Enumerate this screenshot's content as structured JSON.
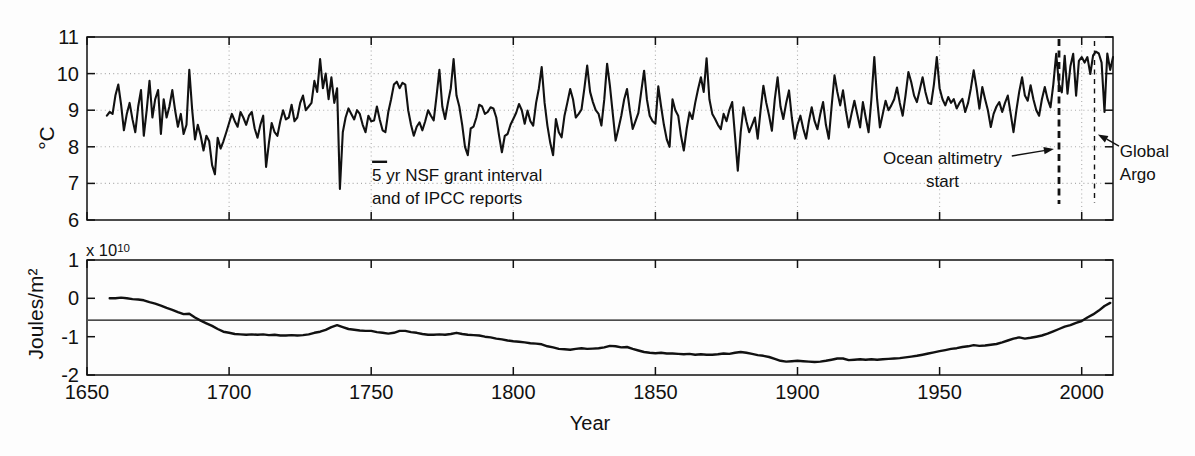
{
  "figure": {
    "background": "#fdfdfd",
    "ink": "#111111",
    "grid_color": "#ababab"
  },
  "axis_labels": {
    "top_y": "°C",
    "bottom_y": "Joules/m²",
    "x": "Year"
  },
  "chart_data": [
    {
      "type": "line",
      "panel": "top",
      "ylabel": "°C",
      "xlim": [
        1650,
        2011
      ],
      "ylim": [
        6,
        11
      ],
      "xticks": [
        1650,
        1700,
        1750,
        1800,
        1850,
        1900,
        1950,
        2000
      ],
      "xtick_labels_shown": false,
      "yticks": [
        6,
        7,
        8,
        9,
        10,
        11
      ],
      "ytick_labels": [
        "6",
        "7",
        "8",
        "9",
        "10",
        "11"
      ],
      "grid_x": [
        1700,
        1750,
        1800,
        1850,
        1900,
        1950,
        2000
      ],
      "grid_y": [
        7,
        8,
        9,
        10
      ],
      "grid_style": "dotted",
      "series": [
        {
          "start_year": 1657,
          "step": 1,
          "values": [
            8.85,
            8.95,
            8.9,
            9.4,
            9.7,
            9.15,
            8.45,
            8.9,
            9.2,
            8.75,
            8.4,
            9.1,
            9.55,
            8.3,
            9.0,
            9.8,
            8.8,
            9.3,
            9.55,
            8.35,
            9.3,
            8.8,
            9.1,
            9.55,
            9.0,
            8.55,
            8.9,
            8.35,
            8.6,
            10.1,
            9.0,
            8.2,
            8.6,
            8.3,
            7.9,
            8.3,
            8.15,
            7.5,
            7.25,
            8.25,
            7.95,
            8.15,
            8.4,
            8.65,
            8.9,
            8.7,
            8.55,
            8.95,
            8.8,
            8.6,
            8.85,
            8.95,
            8.5,
            8.25,
            8.6,
            8.85,
            7.45,
            8.1,
            8.65,
            8.4,
            8.3,
            8.7,
            9.0,
            8.75,
            8.8,
            9.15,
            8.7,
            8.8,
            9.2,
            9.4,
            9.0,
            9.1,
            9.2,
            9.8,
            9.5,
            10.4,
            9.6,
            10.0,
            9.3,
            9.9,
            9.2,
            9.6,
            6.85,
            8.4,
            8.8,
            9.05,
            8.9,
            8.75,
            9.0,
            8.9,
            8.6,
            8.4,
            8.85,
            8.7,
            8.72,
            9.1,
            8.75,
            8.45,
            8.4,
            8.95,
            9.3,
            9.7,
            9.78,
            9.6,
            9.75,
            9.7,
            9.0,
            8.6,
            8.3,
            8.55,
            8.67,
            8.45,
            8.7,
            9.0,
            8.85,
            8.72,
            9.4,
            10.1,
            9.1,
            8.76,
            9.2,
            9.6,
            10.4,
            9.4,
            9.1,
            8.6,
            8.0,
            7.77,
            8.5,
            8.55,
            8.8,
            9.15,
            9.1,
            8.9,
            8.95,
            9.08,
            9.05,
            8.8,
            8.3,
            7.85,
            8.3,
            8.35,
            8.6,
            8.76,
            8.93,
            9.17,
            9.0,
            8.63,
            8.99,
            8.7,
            8.58,
            9.2,
            9.6,
            10.18,
            9.2,
            8.58,
            8.1,
            7.77,
            8.76,
            8.4,
            8.26,
            8.85,
            9.2,
            9.58,
            9.3,
            8.8,
            8.9,
            9.02,
            9.6,
            10.22,
            9.5,
            9.22,
            9.0,
            8.9,
            8.58,
            9.3,
            10.27,
            9.67,
            8.9,
            8.17,
            8.5,
            8.85,
            9.3,
            9.58,
            9.0,
            8.49,
            8.7,
            8.93,
            9.5,
            10.08,
            9.3,
            8.85,
            8.7,
            8.63,
            9.65,
            9.1,
            8.6,
            8.2,
            8.0,
            9.3,
            9.0,
            8.85,
            8.3,
            7.9,
            8.5,
            8.94,
            8.76,
            9.2,
            9.58,
            9.9,
            9.5,
            10.42,
            9.3,
            8.9,
            8.76,
            8.6,
            8.48,
            8.9,
            8.7,
            9.0,
            9.22,
            8.3,
            7.35,
            8.4,
            9.08,
            8.7,
            8.4,
            8.6,
            8.8,
            8.22,
            9.0,
            9.67,
            9.2,
            8.85,
            8.44,
            9.3,
            9.9,
            9.1,
            8.76,
            9.2,
            9.54,
            8.8,
            8.22,
            8.6,
            8.85,
            8.5,
            8.22,
            8.7,
            9.08,
            8.7,
            8.48,
            8.9,
            9.22,
            8.6,
            8.22,
            9.1,
            9.95,
            9.5,
            9.13,
            9.54,
            9.0,
            8.53,
            8.9,
            9.26,
            8.9,
            8.53,
            9.22,
            8.8,
            8.4,
            9.3,
            10.45,
            9.3,
            8.53,
            8.9,
            9.26,
            9.0,
            9.13,
            9.3,
            9.62,
            9.2,
            8.85,
            9.4,
            10.04,
            9.77,
            9.4,
            9.22,
            9.55,
            9.9,
            9.5,
            9.2,
            9.17,
            9.7,
            10.45,
            9.6,
            9.3,
            9.13,
            9.36,
            9.2,
            9.3,
            9.05,
            9.2,
            9.31,
            8.95,
            9.2,
            9.6,
            10.09,
            9.6,
            9.04,
            9.63,
            9.3,
            9.0,
            8.54,
            8.9,
            9.1,
            9.22,
            8.95,
            9.2,
            9.4,
            8.9,
            8.4,
            9.0,
            9.5,
            9.9,
            9.4,
            9.26,
            9.68,
            9.3,
            9.0,
            8.85,
            9.3,
            9.63,
            9.3,
            9.08,
            9.7,
            10.54,
            9.7,
            9.49,
            10.49,
            9.45,
            10.2,
            10.54,
            9.4,
            10.35,
            10.45,
            10.3,
            10.45,
            9.99,
            10.5,
            10.6,
            10.55,
            10.3,
            8.95,
            10.55,
            10.1,
            10.45
          ]
        }
      ],
      "vlines": [
        {
          "year": 1992,
          "style": "thick-dashed",
          "meaning": "Ocean altimetry start"
        },
        {
          "year": 2004.5,
          "style": "thin-dashed",
          "meaning": "Global Argo"
        }
      ],
      "annotations": [
        {
          "id": "nsf",
          "lines": [
            "5 yr NSF grant interval",
            "and of IPCC reports"
          ],
          "align": "left",
          "anchor_year": 1750.3,
          "anchor_value": 7.53,
          "scalebar": {
            "year_start": 1750.3,
            "year_end": 1755.6,
            "value": 7.59
          }
        },
        {
          "id": "altimetry",
          "lines": [
            "Ocean altimetry",
            "start"
          ],
          "align": "center",
          "anchor_year": 1951,
          "anchor_value": 8.0,
          "arrow": {
            "from_year": 1975.4,
            "from_value": 7.75,
            "to_year": 1990.2,
            "to_value": 7.94
          }
        },
        {
          "id": "argo",
          "lines": [
            "Global",
            "Argo"
          ],
          "align": "left",
          "anchor_year": 2013.4,
          "anchor_value": 8.19,
          "arrow": {
            "from_year": 2013.1,
            "from_value": 8.02,
            "to_year": 2005.7,
            "to_value": 8.34
          }
        }
      ]
    },
    {
      "type": "line",
      "panel": "bottom",
      "ylabel": "Joules/m²",
      "scale_label": {
        "base": "x 10",
        "exp": "10"
      },
      "xlabel": "Year",
      "xlim": [
        1650,
        2011
      ],
      "ylim": [
        -2,
        1
      ],
      "xticks": [
        1650,
        1700,
        1750,
        1800,
        1850,
        1900,
        1950,
        2000
      ],
      "xtick_labels": [
        "1650",
        "1700",
        "1750",
        "1800",
        "1850",
        "1900",
        "1950",
        "2000"
      ],
      "yticks": [
        -2,
        -1,
        0,
        1
      ],
      "ytick_labels": [
        "-2",
        "-1",
        "0",
        "1"
      ],
      "grid": "none",
      "hline": -0.57,
      "series": [
        {
          "start_year": 1658,
          "step": 2,
          "values": [
            0.0,
            0.0,
            0.02,
            0.0,
            -0.02,
            -0.03,
            -0.05,
            -0.1,
            -0.14,
            -0.19,
            -0.25,
            -0.3,
            -0.36,
            -0.41,
            -0.4,
            -0.5,
            -0.58,
            -0.65,
            -0.72,
            -0.8,
            -0.87,
            -0.9,
            -0.93,
            -0.94,
            -0.95,
            -0.94,
            -0.95,
            -0.94,
            -0.96,
            -0.95,
            -0.97,
            -0.97,
            -0.96,
            -0.97,
            -0.96,
            -0.94,
            -0.9,
            -0.87,
            -0.82,
            -0.75,
            -0.7,
            -0.75,
            -0.8,
            -0.82,
            -0.84,
            -0.85,
            -0.85,
            -0.88,
            -0.9,
            -0.92,
            -0.9,
            -0.85,
            -0.85,
            -0.88,
            -0.9,
            -0.93,
            -0.95,
            -0.95,
            -0.94,
            -0.95,
            -0.93,
            -0.9,
            -0.93,
            -0.95,
            -0.96,
            -0.97,
            -1.0,
            -1.02,
            -1.05,
            -1.07,
            -1.1,
            -1.12,
            -1.13,
            -1.15,
            -1.17,
            -1.18,
            -1.2,
            -1.25,
            -1.28,
            -1.32,
            -1.33,
            -1.34,
            -1.32,
            -1.3,
            -1.32,
            -1.31,
            -1.3,
            -1.28,
            -1.24,
            -1.25,
            -1.28,
            -1.27,
            -1.32,
            -1.36,
            -1.4,
            -1.42,
            -1.43,
            -1.42,
            -1.44,
            -1.44,
            -1.45,
            -1.46,
            -1.45,
            -1.47,
            -1.46,
            -1.47,
            -1.47,
            -1.46,
            -1.44,
            -1.45,
            -1.42,
            -1.4,
            -1.42,
            -1.45,
            -1.48,
            -1.5,
            -1.53,
            -1.58,
            -1.63,
            -1.65,
            -1.64,
            -1.63,
            -1.64,
            -1.65,
            -1.66,
            -1.65,
            -1.63,
            -1.6,
            -1.57,
            -1.57,
            -1.61,
            -1.6,
            -1.59,
            -1.6,
            -1.59,
            -1.6,
            -1.59,
            -1.58,
            -1.57,
            -1.56,
            -1.54,
            -1.52,
            -1.5,
            -1.47,
            -1.44,
            -1.41,
            -1.38,
            -1.35,
            -1.32,
            -1.3,
            -1.27,
            -1.25,
            -1.22,
            -1.24,
            -1.23,
            -1.21,
            -1.19,
            -1.15,
            -1.1,
            -1.05,
            -1.02,
            -1.05,
            -1.03,
            -1.0,
            -0.97,
            -0.92,
            -0.86,
            -0.8,
            -0.74,
            -0.7,
            -0.64,
            -0.59,
            -0.5,
            -0.42,
            -0.32,
            -0.2,
            -0.12
          ]
        }
      ]
    }
  ]
}
